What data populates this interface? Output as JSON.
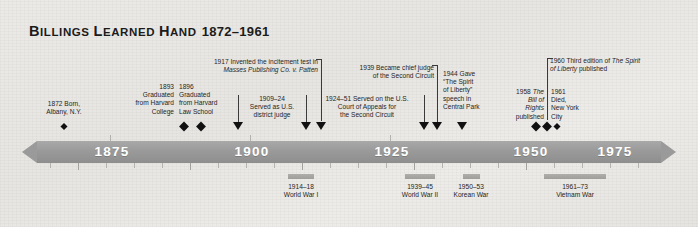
{
  "title": {
    "name_part1": "B",
    "name_rest1": "ILLINGS ",
    "name_part2": "L",
    "name_rest2": "EARNED ",
    "name_part3": "H",
    "name_rest3": "AND",
    "full_name": "BILLINGS LEARNED HAND",
    "years": "1872–1961"
  },
  "axis": {
    "ticks": [
      "1875",
      "1900",
      "1925",
      "1950",
      "1975"
    ],
    "start_year": 1868,
    "end_year": 1980
  },
  "events": [
    {
      "id": "born",
      "year": 1872,
      "lines": [
        "1872 Born,",
        "Albany, N.Y."
      ],
      "marker": "diamond"
    },
    {
      "id": "harvard-college",
      "year": 1893,
      "lines": [
        "1893",
        "Graduated",
        "from Harvard",
        "College"
      ],
      "marker": "diamond"
    },
    {
      "id": "harvard-law",
      "year": 1896,
      "lines": [
        "1896",
        "Graduated",
        "from Harvard",
        "Law School"
      ],
      "marker": "diamond"
    },
    {
      "id": "district-judge",
      "year_label": "1909–24",
      "lines": [
        "1909–24",
        "Served as U.S.",
        "district judge"
      ],
      "marker": "bracket"
    },
    {
      "id": "masses-publishing",
      "year": 1917,
      "lines": [
        "1917 Invented the incitement test in"
      ],
      "italic_line": "Masses Publishing Co. v. Patten",
      "marker": "bracket"
    },
    {
      "id": "second-circuit",
      "year_label": "1924–51",
      "lines": [
        "1924–51 Served on the U.S.",
        "Court of Appeals for",
        "the Second Circuit"
      ],
      "marker": "bracket"
    },
    {
      "id": "chief-judge",
      "year": 1939,
      "lines": [
        "1939 Became chief judge",
        "of the Second Circuit"
      ],
      "marker": "triangle"
    },
    {
      "id": "spirit-of-liberty-speech",
      "year": 1944,
      "lines": [
        "1944 Gave",
        "“The Spirit",
        "of Liberty”",
        "speech in",
        "Central Park"
      ],
      "marker": "triangle"
    },
    {
      "id": "bill-of-rights",
      "year": 1958,
      "lines": [
        "1958 ",
        "published"
      ],
      "italic_line": "The Bill of Rights",
      "marker": "diamond"
    },
    {
      "id": "third-edition",
      "year": 1960,
      "lines": [
        "1960 Third edition of ",
        " published"
      ],
      "italic_line": "The Spirit of Liberty",
      "marker": "diamond"
    },
    {
      "id": "died",
      "year": 1961,
      "lines": [
        "1961",
        "Died,",
        "New York",
        "City"
      ],
      "marker": "diamond"
    }
  ],
  "wars": [
    {
      "id": "world-war-i",
      "range": "1914–18",
      "name": "World War I",
      "start": 1914,
      "end": 1918
    },
    {
      "id": "world-war-ii",
      "range": "1939–45",
      "name": "World War II",
      "start": 1939,
      "end": 1945
    },
    {
      "id": "korean-war",
      "range": "1950–53",
      "name": "Korean War",
      "start": 1950,
      "end": 1953
    },
    {
      "id": "vietnam-war",
      "range": "1961–73",
      "name": "Vietnam War",
      "start": 1961,
      "end": 1973
    }
  ],
  "annotations": {
    "born": "1872 Born,\nAlbany, N.Y.",
    "college": "1893\nGraduated\nfrom Harvard\nCollege",
    "law": "1896\nGraduated\nfrom Harvard\nLaw School",
    "district": "1909–24\nServed as U.S.\ndistrict judge",
    "masses_a": "1917 Invented the incitement test in",
    "masses_b": "Masses Publishing Co. v. Patten",
    "circuit": "1924–51 Served on the U.S.\nCourt of Appeals for\nthe Second Circuit",
    "chief": "1939 Became chief judge\nof the Second Circuit",
    "speech": "1944 Gave\n“The Spirit\nof Liberty”\nspeech in\nCentral Park",
    "bill_pre": "1958 ",
    "bill_italic": "The\nBill of\nRights",
    "bill_post": "published",
    "third_pre": "1960 Third edition of ",
    "third_italic": "The Spirit",
    "third_mid": "of Liberty",
    "third_post": " published",
    "died": "1961\nDied,\nNew York\nCity"
  },
  "colors": {
    "bar": "#9a9a9a",
    "marker": "#111111",
    "war_bar": "#a8a6a2",
    "background": "#eceae6",
    "text": "#1f1f1f"
  }
}
